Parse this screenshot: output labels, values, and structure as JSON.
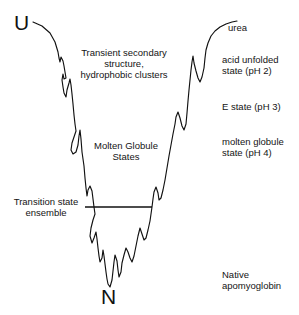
{
  "figure": {
    "kind": "protein-folding-energy-funnel",
    "background_color": "#ffffff",
    "line_color": "#111111"
  },
  "endpoints": {
    "unfolded_label": "U",
    "native_label": "N"
  },
  "inner_annotations": {
    "transient": "Transient secondary\nstructure,\nhydrophobic clusters",
    "molten_globule_states": "Molten Globule\nStates",
    "transition_state": "Transition state\nensemble"
  },
  "right_column": {
    "urea": "urea",
    "acid_unfolded": "acid unfolded\nstate (pH 2)",
    "e_state": "E state (pH 3)",
    "molten_globule": "molten globule\nstate (pH 4)",
    "native": "Native\napomyoglobin"
  },
  "chart_data": {
    "type": "line",
    "title": "",
    "xlabel": "",
    "ylabel": "",
    "grid": false,
    "legend": null,
    "annotations": [
      {
        "text": "U",
        "x": 22,
        "y": 24
      },
      {
        "text": "N",
        "x": 110,
        "y": 296
      },
      {
        "text": "Transient secondary structure, hydrophobic clusters",
        "x": 124,
        "y": 64
      },
      {
        "text": "Molten Globule States",
        "x": 126,
        "y": 152
      },
      {
        "text": "Transition state ensemble",
        "x": 46,
        "y": 208
      },
      {
        "text": "urea",
        "x": 252,
        "y": 29
      },
      {
        "text": "acid unfolded state (pH 2)",
        "x": 258,
        "y": 67
      },
      {
        "text": "E state (pH 3)",
        "x": 258,
        "y": 108
      },
      {
        "text": "molten globule state (pH 4)",
        "x": 258,
        "y": 149
      },
      {
        "text": "Native apomyoglobin",
        "x": 258,
        "y": 282
      }
    ],
    "transition_state_line": {
      "x1": 85,
      "x2": 152,
      "y": 207
    },
    "funnel_path_points": [
      [
        33,
        22
      ],
      [
        42,
        26
      ],
      [
        50,
        33
      ],
      [
        55,
        42
      ],
      [
        58,
        52
      ],
      [
        59,
        58
      ],
      [
        60,
        62
      ],
      [
        61,
        57
      ],
      [
        63,
        61
      ],
      [
        64,
        66
      ],
      [
        65,
        72
      ],
      [
        66,
        78
      ],
      [
        64,
        79
      ],
      [
        63,
        74
      ],
      [
        62,
        80
      ],
      [
        63,
        87
      ],
      [
        64,
        93
      ],
      [
        66,
        97
      ],
      [
        67,
        90
      ],
      [
        69,
        83
      ],
      [
        70,
        79
      ],
      [
        71,
        85
      ],
      [
        72,
        94
      ],
      [
        73,
        104
      ],
      [
        74,
        115
      ],
      [
        75,
        124
      ],
      [
        76,
        131
      ],
      [
        74,
        137
      ],
      [
        72,
        143
      ],
      [
        71,
        150
      ],
      [
        73,
        154
      ],
      [
        76,
        152
      ],
      [
        78,
        145
      ],
      [
        79,
        136
      ],
      [
        80,
        130
      ],
      [
        81,
        139
      ],
      [
        82,
        152
      ],
      [
        84,
        166
      ],
      [
        85,
        178
      ],
      [
        86,
        188
      ],
      [
        87,
        196
      ],
      [
        88,
        190
      ],
      [
        90,
        186
      ],
      [
        92,
        191
      ],
      [
        93,
        199
      ],
      [
        94,
        207
      ],
      [
        95,
        214
      ],
      [
        93,
        220
      ],
      [
        91,
        228
      ],
      [
        90,
        236
      ],
      [
        92,
        243
      ],
      [
        94,
        238
      ],
      [
        96,
        232
      ],
      [
        97,
        239
      ],
      [
        98,
        248
      ],
      [
        99,
        256
      ],
      [
        100,
        262
      ],
      [
        102,
        258
      ],
      [
        103,
        250
      ],
      [
        104,
        256
      ],
      [
        105,
        264
      ],
      [
        106,
        272
      ],
      [
        107,
        279
      ],
      [
        108,
        284
      ],
      [
        110,
        287
      ],
      [
        112,
        280
      ],
      [
        113,
        271
      ],
      [
        114,
        262
      ],
      [
        115,
        255
      ],
      [
        117,
        261
      ],
      [
        118,
        270
      ],
      [
        119,
        277
      ],
      [
        121,
        272
      ],
      [
        122,
        263
      ],
      [
        124,
        255
      ],
      [
        126,
        248
      ],
      [
        128,
        252
      ],
      [
        130,
        258
      ],
      [
        132,
        262
      ],
      [
        134,
        256
      ],
      [
        136,
        246
      ],
      [
        138,
        236
      ],
      [
        140,
        228
      ],
      [
        142,
        234
      ],
      [
        144,
        240
      ],
      [
        146,
        238
      ],
      [
        148,
        230
      ],
      [
        150,
        221
      ],
      [
        151,
        214
      ],
      [
        152,
        207
      ],
      [
        153,
        199
      ],
      [
        154,
        192
      ],
      [
        156,
        187
      ],
      [
        158,
        193
      ],
      [
        159,
        200
      ],
      [
        161,
        198
      ],
      [
        163,
        190
      ],
      [
        165,
        180
      ],
      [
        167,
        168
      ],
      [
        169,
        156
      ],
      [
        171,
        145
      ],
      [
        173,
        134
      ],
      [
        175,
        124
      ],
      [
        176,
        117
      ],
      [
        178,
        112
      ],
      [
        180,
        118
      ],
      [
        182,
        126
      ],
      [
        184,
        130
      ],
      [
        186,
        124
      ],
      [
        187,
        113
      ],
      [
        188,
        101
      ],
      [
        189,
        90
      ],
      [
        190,
        80
      ],
      [
        191,
        70
      ],
      [
        192,
        62
      ],
      [
        193,
        56
      ],
      [
        194,
        63
      ],
      [
        196,
        71
      ],
      [
        198,
        78
      ],
      [
        200,
        82
      ],
      [
        202,
        77
      ],
      [
        204,
        68
      ],
      [
        205,
        58
      ],
      [
        206,
        50
      ],
      [
        208,
        43
      ],
      [
        211,
        36
      ],
      [
        215,
        31
      ],
      [
        220,
        27
      ],
      [
        226,
        24
      ],
      [
        232,
        22
      ],
      [
        237,
        21
      ]
    ]
  }
}
